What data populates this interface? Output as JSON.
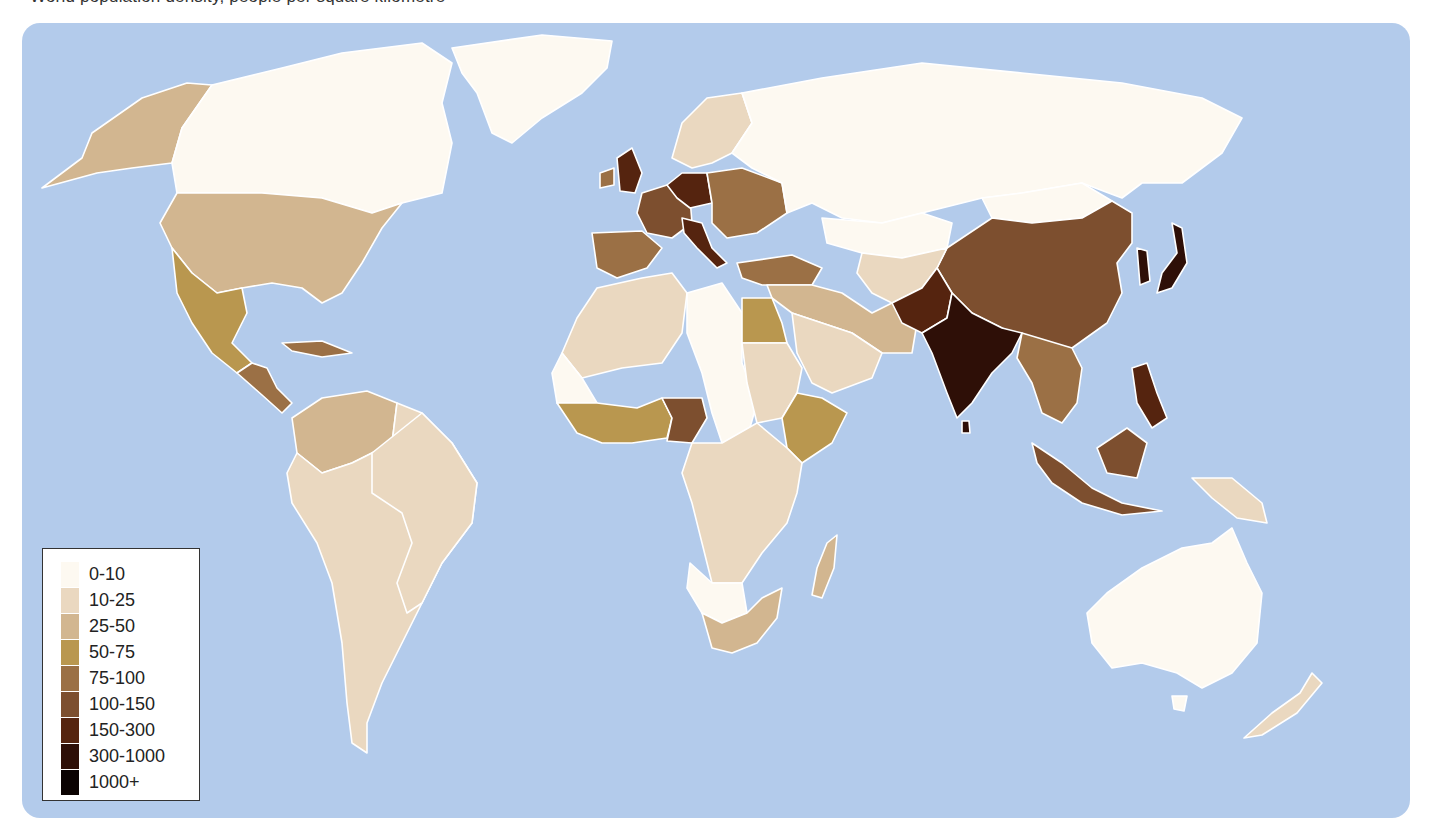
{
  "header": {
    "caption": "World population density, people per square kilometre"
  },
  "map": {
    "ocean_color": "#b3cbeb",
    "border_color": "#ffffff"
  },
  "legend": {
    "items": [
      {
        "label": "0-10",
        "color": "#fdf9f1"
      },
      {
        "label": "10-25",
        "color": "#ead8c0"
      },
      {
        "label": "25-50",
        "color": "#d2b690"
      },
      {
        "label": "50-75",
        "color": "#b9974f"
      },
      {
        "label": "75-100",
        "color": "#9b7045"
      },
      {
        "label": "100-150",
        "color": "#7d4f2f"
      },
      {
        "label": "150-300",
        "color": "#55240f"
      },
      {
        "label": "300-1000",
        "color": "#2e0f07"
      },
      {
        "label": "1000+",
        "color": "#0b0302"
      }
    ]
  },
  "regions": {
    "canada": "0-10",
    "alaska": "25-50",
    "usa": "25-50",
    "mexico": "50-75",
    "central_america": "75-100",
    "greenland": "0-10",
    "south_america": "10-25",
    "brazil": "10-25",
    "colombia": "25-50",
    "russia": "0-10",
    "europe_west": "100-150",
    "germany_benelux": "150-300",
    "uk": "150-300",
    "iberia": "75-100",
    "scandinavia": "10-25",
    "eastern_europe": "75-100",
    "turkey": "75-100",
    "north_africa_west": "10-25",
    "sahara_west": "0-10",
    "libya_chad": "0-10",
    "egypt": "50-75",
    "nigeria": "100-150",
    "west_africa": "50-75",
    "central_africa": "10-25",
    "east_africa": "50-75",
    "southern_africa": "25-50",
    "namibia_botswana": "0-10",
    "madagascar": "25-50",
    "middle_east": "25-50",
    "arabia": "10-25",
    "kazakhstan": "0-10",
    "central_asia": "10-25",
    "china": "100-150",
    "mongolia": "0-10",
    "india": "300-1000",
    "pakistan": "150-300",
    "southeast_asia": "75-100",
    "korea_japan": "300-1000",
    "philippines": "150-300",
    "indonesia": "100-150",
    "papua": "10-25",
    "australia": "0-10",
    "new_zealand": "10-25"
  }
}
